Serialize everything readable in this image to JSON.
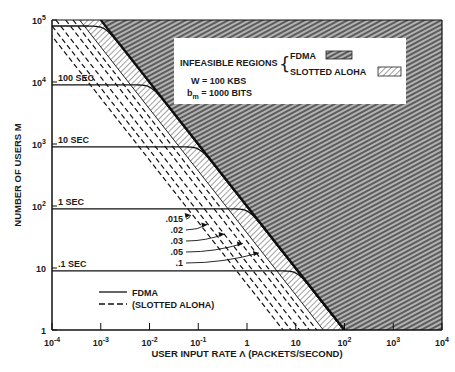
{
  "chart_data": {
    "type": "line",
    "title": "",
    "xlabel": "USER INPUT RATE Λ (PACKETS/SECOND)",
    "ylabel": "NUMBER OF USERS M",
    "xscale": "log",
    "yscale": "log",
    "xlim": [
      0.0001,
      10000
    ],
    "ylim": [
      1,
      100000
    ],
    "x_ticks": [
      {
        "value": 0.0001,
        "base": "10",
        "exp": "-4"
      },
      {
        "value": 0.001,
        "base": "10",
        "exp": "-3"
      },
      {
        "value": 0.01,
        "base": "10",
        "exp": "-2"
      },
      {
        "value": 0.1,
        "base": "10",
        "exp": "-1"
      },
      {
        "value": 1,
        "base": "1",
        "exp": ""
      },
      {
        "value": 10,
        "base": "10",
        "exp": ""
      },
      {
        "value": 100,
        "base": "10",
        "exp": "2"
      },
      {
        "value": 1000,
        "base": "10",
        "exp": "3"
      },
      {
        "value": 10000,
        "base": "10",
        "exp": "4"
      }
    ],
    "y_ticks": [
      {
        "value": 1,
        "base": "1",
        "exp": ""
      },
      {
        "value": 10,
        "base": "10",
        "exp": ""
      },
      {
        "value": 100,
        "base": "10",
        "exp": "2"
      },
      {
        "value": 1000,
        "base": "10",
        "exp": "3"
      },
      {
        "value": 10000,
        "base": "10",
        "exp": "4"
      },
      {
        "value": 100000,
        "base": "10",
        "exp": "5"
      }
    ],
    "grid": false,
    "fdma_boundary_product": 100,
    "aloha_boundary_product": 36.8,
    "series": [
      {
        "name": "FDMA 100 SEC",
        "style": "solid",
        "label": "100 SEC",
        "M_plateau": 9000
      },
      {
        "name": "FDMA 10 SEC",
        "style": "solid",
        "label": "10 SEC",
        "M_plateau": 900
      },
      {
        "name": "FDMA 1 SEC",
        "style": "solid",
        "label": "1 SEC",
        "M_plateau": 90
      },
      {
        "name": "FDMA .1 SEC",
        "style": "solid",
        "label": ".1 SEC",
        "M_plateau": 9
      },
      {
        "name": "FDMA top",
        "style": "solid",
        "label": "",
        "M_plateau": 80000
      },
      {
        "name": "Slotted ALOHA .015",
        "style": "dashed",
        "label": ".015",
        "product": 5.5
      },
      {
        "name": "Slotted ALOHA .02",
        "style": "dashed",
        "label": ".02",
        "product": 8
      },
      {
        "name": "Slotted ALOHA .03",
        "style": "dashed",
        "label": ".03",
        "product": 12
      },
      {
        "name": "Slotted ALOHA .05",
        "style": "dashed",
        "label": ".05",
        "product": 19
      },
      {
        "name": "Slotted ALOHA .1",
        "style": "dashed",
        "label": ".1",
        "product": 27
      }
    ],
    "legend": {
      "position": "lower-left",
      "entries": [
        {
          "style": "solid",
          "label": "FDMA"
        },
        {
          "style": "dashed",
          "label": "(SLOTTED ALOHA)"
        }
      ]
    },
    "annotations": {
      "infeasible_title": "INFEASIBLE REGIONS",
      "infeasible_fdma": "FDMA",
      "infeasible_aloha": "SLOTTED ALOHA",
      "param_w": "W = 100 KBS",
      "param_b_main": "b",
      "param_b_sub": "m",
      "param_b_rest": " = 1000 BITS"
    }
  }
}
